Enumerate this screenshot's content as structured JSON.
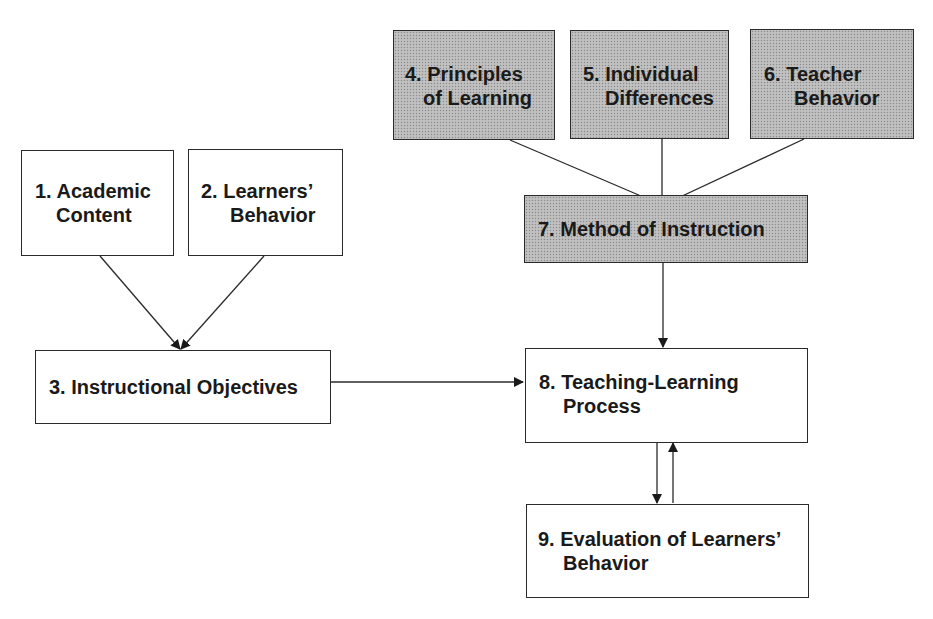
{
  "diagram": {
    "nodes": [
      {
        "id": 1,
        "line1": "1. Academic",
        "line2": "Content",
        "shaded": false
      },
      {
        "id": 2,
        "line1": "2. Learners’",
        "line2": "Behavior",
        "shaded": false
      },
      {
        "id": 3,
        "line1": "3. Instructional Objectives",
        "line2": "",
        "shaded": false
      },
      {
        "id": 4,
        "line1": "4. Principles",
        "line2": "of Learning",
        "shaded": true
      },
      {
        "id": 5,
        "line1": "5. Individual",
        "line2": "Differences",
        "shaded": true
      },
      {
        "id": 6,
        "line1": "6. Teacher",
        "line2": "Behavior",
        "shaded": true
      },
      {
        "id": 7,
        "line1": "7. Method of Instruction",
        "line2": "",
        "shaded": true
      },
      {
        "id": 8,
        "line1": "8. Teaching-Learning",
        "line2": "Process",
        "shaded": false
      },
      {
        "id": 9,
        "line1": "9. Evaluation of Learners’",
        "line2": "Behavior",
        "shaded": false
      }
    ],
    "edges": [
      {
        "from": 1,
        "to": 3
      },
      {
        "from": 2,
        "to": 3
      },
      {
        "from": 3,
        "to": 8
      },
      {
        "from": 4,
        "to": 7
      },
      {
        "from": 5,
        "to": 7
      },
      {
        "from": 6,
        "to": 7
      },
      {
        "from": 7,
        "to": 8
      },
      {
        "from": 8,
        "to": 9
      },
      {
        "from": 9,
        "to": 8
      }
    ],
    "colors": {
      "line": "#2a2a2a",
      "shaded_fill": "#b9b9b9",
      "plain_fill": "#ffffff"
    }
  }
}
